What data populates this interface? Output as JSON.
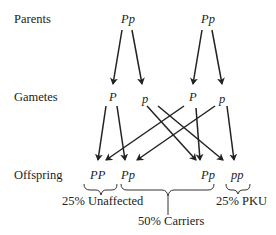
{
  "rows": {
    "parents_label": "Parents",
    "gametes_label": "Gametes",
    "offspring_label": "Offspring"
  },
  "parents": [
    "Pp",
    "Pp"
  ],
  "gametes": [
    "P",
    "p",
    "P",
    "p"
  ],
  "offspring": [
    "PP",
    "Pp",
    "Pp",
    "pp"
  ],
  "outcomes": {
    "unaffected": "25% Unaffected",
    "carriers": "50% Carriers",
    "pku": "25% PKU"
  },
  "colors": {
    "line": "#222222",
    "text": "#222222",
    "background": "#ffffff"
  }
}
